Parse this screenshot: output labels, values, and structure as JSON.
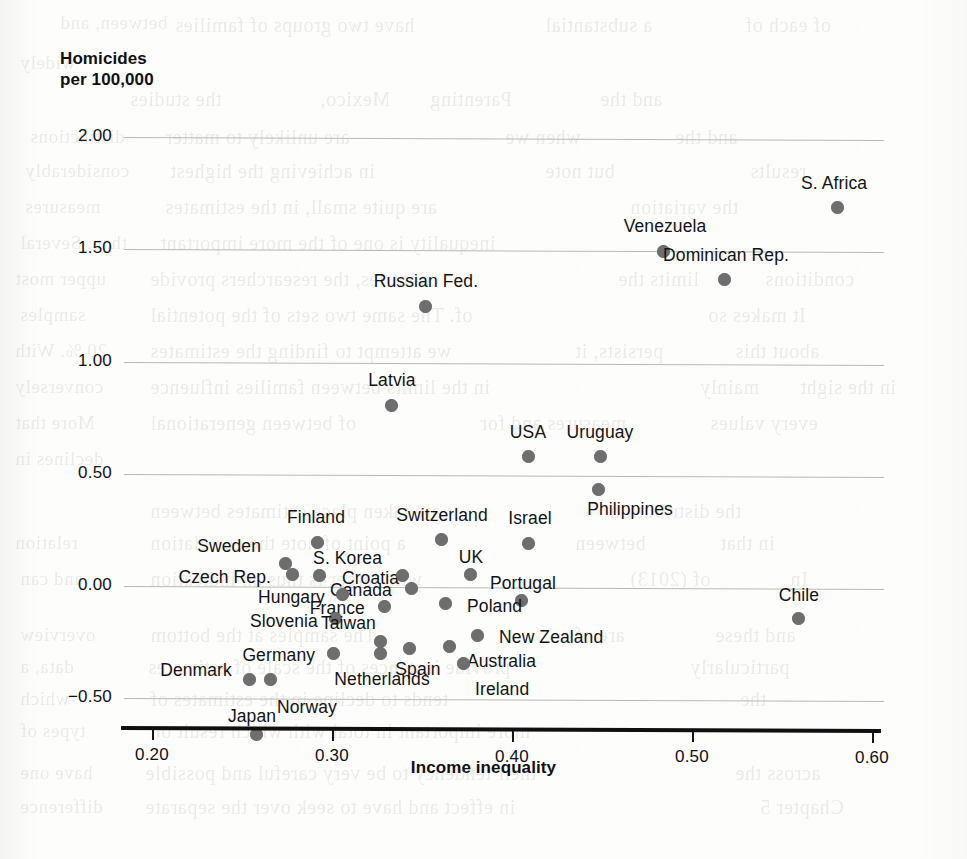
{
  "chart_data": {
    "type": "scatter",
    "title": "",
    "ylabel_line1": "Homicides",
    "ylabel_line2": "per 100,000",
    "xlabel": "Income inequality",
    "xlim": [
      0.155,
      0.635
    ],
    "ylim": [
      -0.62,
      2.16
    ],
    "grid": true,
    "legend": "none",
    "xticks": [
      "0.20",
      "0.30",
      "0.40",
      "0.50",
      "0.60"
    ],
    "xtick_values": [
      0.2,
      0.3,
      0.4,
      0.5,
      0.6
    ],
    "yticks": [
      "2.00",
      "1.50",
      "1.00",
      "0.50",
      "0.00",
      "−0.50"
    ],
    "ytick_values": [
      2.0,
      1.5,
      1.0,
      0.5,
      0.0,
      -0.5
    ],
    "point_color": "#6e6e6e",
    "points": [
      {
        "label": "S. Africa",
        "x": 0.5806,
        "y": 1.685,
        "lx": -3,
        "ly": -26,
        "anchor": "middle"
      },
      {
        "label": "Venezuela",
        "x": 0.4839,
        "y": 1.49,
        "lx": 2,
        "ly": -26,
        "anchor": "middle"
      },
      {
        "label": "Dominican Rep.",
        "x": 0.5178,
        "y": 1.365,
        "lx": 2,
        "ly": -26,
        "anchor": "middle"
      },
      {
        "label": "Russian Fed.",
        "x": 0.3522,
        "y": 1.245,
        "lx": 0,
        "ly": -26,
        "anchor": "middle"
      },
      {
        "label": "Latvia",
        "x": 0.3333,
        "y": 0.805,
        "lx": 0,
        "ly": -26,
        "anchor": "middle"
      },
      {
        "label": "USA",
        "x": 0.4089,
        "y": 0.575,
        "lx": 0,
        "ly": -26,
        "anchor": "middle"
      },
      {
        "label": "Uruguay",
        "x": 0.4489,
        "y": 0.575,
        "lx": 0,
        "ly": -26,
        "anchor": "middle"
      },
      {
        "label": "Philippines",
        "x": 0.4478,
        "y": 0.43,
        "lx": 32,
        "ly": 19,
        "anchor": "middle"
      },
      {
        "label": "Israel",
        "x": 0.4089,
        "y": 0.19,
        "lx": 2,
        "ly": -26,
        "anchor": "middle"
      },
      {
        "label": "Switzerland",
        "x": 0.3611,
        "y": 0.205,
        "lx": 0,
        "ly": -26,
        "anchor": "middle"
      },
      {
        "label": "Finland",
        "x": 0.2922,
        "y": 0.195,
        "lx": -2,
        "ly": -26,
        "anchor": "middle"
      },
      {
        "label": "Sweden",
        "x": 0.2739,
        "y": 0.1,
        "lx": -24,
        "ly": -19,
        "anchor": "end"
      },
      {
        "label": "Czech Rep.",
        "x": 0.2783,
        "y": 0.05,
        "lx": -22,
        "ly": 1,
        "anchor": "end"
      },
      {
        "label": "Croatia",
        "x": 0.2933,
        "y": 0.045,
        "lx": 22,
        "ly": 1,
        "anchor": "start"
      },
      {
        "label": "S. Korea",
        "x": 0.3389,
        "y": 0.045,
        "lx": -20,
        "ly": -19,
        "anchor": "end"
      },
      {
        "label": "Canada",
        "x": 0.3444,
        "y": -0.01,
        "lx": -20,
        "ly": 1,
        "anchor": "end"
      },
      {
        "label": "UK",
        "x": 0.3772,
        "y": 0.05,
        "lx": 0,
        "ly": -19,
        "anchor": "middle"
      },
      {
        "label": "Portugal",
        "x": 0.405,
        "y": -0.065,
        "lx": 2,
        "ly": -19,
        "anchor": "middle"
      },
      {
        "label": "Hungary",
        "x": 0.3061,
        "y": -0.04,
        "lx": -18,
        "ly": 1,
        "anchor": "end"
      },
      {
        "label": "France",
        "x": 0.3294,
        "y": -0.09,
        "lx": -20,
        "ly": 1,
        "anchor": "end"
      },
      {
        "label": "Slovenia",
        "x": 0.3022,
        "y": -0.145,
        "lx": -18,
        "ly": 1,
        "anchor": "end"
      },
      {
        "label": "Poland",
        "x": 0.3628,
        "y": -0.08,
        "lx": 22,
        "ly": 1,
        "anchor": "start"
      },
      {
        "label": "Taiwan",
        "x": 0.3272,
        "y": -0.245,
        "lx": -5,
        "ly": -19,
        "anchor": "end"
      },
      {
        "label": "Germany",
        "x": 0.3006,
        "y": -0.3,
        "lx": -18,
        "ly": 1,
        "anchor": "end"
      },
      {
        "label": "New Zealand",
        "x": 0.3806,
        "y": -0.22,
        "lx": 22,
        "ly": 1,
        "anchor": "start"
      },
      {
        "label": "Australia",
        "x": 0.365,
        "y": -0.27,
        "lx": 18,
        "ly": 13,
        "anchor": "start"
      },
      {
        "label": "Spain",
        "x": 0.3433,
        "y": -0.28,
        "lx": 8,
        "ly": 19,
        "anchor": "middle"
      },
      {
        "label": "Netherlands",
        "x": 0.3267,
        "y": -0.3,
        "lx": 2,
        "ly": 25,
        "anchor": "middle"
      },
      {
        "label": "Ireland",
        "x": 0.3728,
        "y": -0.345,
        "lx": 12,
        "ly": 25,
        "anchor": "start"
      },
      {
        "label": "Denmark",
        "x": 0.2544,
        "y": -0.415,
        "lx": -18,
        "ly": -10,
        "anchor": "end"
      },
      {
        "label": "Norway",
        "x": 0.2661,
        "y": -0.415,
        "lx": 36,
        "ly": 27,
        "anchor": "middle"
      },
      {
        "label": "Japan",
        "x": 0.2578,
        "y": -0.66,
        "lx": -4,
        "ly": -19,
        "anchor": "middle"
      },
      {
        "label": "Chile",
        "x": 0.5594,
        "y": -0.145,
        "lx": 0,
        "ly": -25,
        "anchor": "middle"
      }
    ]
  },
  "bleed_text": [
    {
      "t": "between, and",
      "x": 60,
      "y": 12,
      "s": 19
    },
    {
      "t": "have two groups of families",
      "x": 175,
      "y": 14,
      "s": 20
    },
    {
      "t": "a substantial",
      "x": 545,
      "y": 14,
      "s": 20
    },
    {
      "t": "of each of",
      "x": 745,
      "y": 14,
      "s": 20
    },
    {
      "t": "widely",
      "x": 20,
      "y": 52,
      "s": 19
    },
    {
      "t": "the studies",
      "x": 130,
      "y": 88,
      "s": 20
    },
    {
      "t": "Mexico,",
      "x": 320,
      "y": 88,
      "s": 20
    },
    {
      "t": "Parenting",
      "x": 430,
      "y": 88,
      "s": 20
    },
    {
      "t": "and the",
      "x": 600,
      "y": 88,
      "s": 20
    },
    {
      "t": "distinctions",
      "x": 30,
      "y": 126,
      "s": 19
    },
    {
      "t": "are unlikely to matter",
      "x": 165,
      "y": 126,
      "s": 20
    },
    {
      "t": "when we",
      "x": 505,
      "y": 126,
      "s": 20
    },
    {
      "t": "and the",
      "x": 675,
      "y": 126,
      "s": 20
    },
    {
      "t": "considerably",
      "x": 25,
      "y": 160,
      "s": 19
    },
    {
      "t": "in achieving the highest",
      "x": 170,
      "y": 160,
      "s": 20
    },
    {
      "t": "but note",
      "x": 545,
      "y": 160,
      "s": 20
    },
    {
      "t": "results",
      "x": 750,
      "y": 160,
      "s": 20
    },
    {
      "t": "measures",
      "x": 25,
      "y": 196,
      "s": 19
    },
    {
      "t": "are quite small, in the estimates",
      "x": 165,
      "y": 196,
      "s": 20
    },
    {
      "t": "the variation",
      "x": 630,
      "y": 196,
      "s": 20
    },
    {
      "t": "than. Several",
      "x": 20,
      "y": 232,
      "s": 19
    },
    {
      "t": "inequality is one of the more important",
      "x": 160,
      "y": 232,
      "s": 20
    },
    {
      "t": "upper most",
      "x": 15,
      "y": 268,
      "s": 19
    },
    {
      "t": "countries, the researchers provide",
      "x": 150,
      "y": 268,
      "s": 20
    },
    {
      "t": "limits the",
      "x": 618,
      "y": 268,
      "s": 20
    },
    {
      "t": "conditions",
      "x": 765,
      "y": 268,
      "s": 20
    },
    {
      "t": "samples",
      "x": 20,
      "y": 304,
      "s": 19
    },
    {
      "t": "of. The same two sets of the potential",
      "x": 150,
      "y": 304,
      "s": 20
    },
    {
      "t": "It makes so",
      "x": 708,
      "y": 304,
      "s": 20
    },
    {
      "t": "20 %. With",
      "x": 15,
      "y": 340,
      "s": 19
    },
    {
      "t": "we attempt to finding the estimates",
      "x": 150,
      "y": 340,
      "s": 20
    },
    {
      "t": "persists, it",
      "x": 575,
      "y": 340,
      "s": 20
    },
    {
      "t": "about this",
      "x": 735,
      "y": 340,
      "s": 20
    },
    {
      "t": "conversely",
      "x": 15,
      "y": 376,
      "s": 19
    },
    {
      "t": "in the limits between families influence",
      "x": 150,
      "y": 376,
      "s": 20
    },
    {
      "t": "mainly",
      "x": 700,
      "y": 376,
      "s": 20
    },
    {
      "t": "in the sight",
      "x": 800,
      "y": 376,
      "s": 20
    },
    {
      "t": "More that",
      "x": 15,
      "y": 412,
      "s": 19
    },
    {
      "t": "of between generational",
      "x": 150,
      "y": 412,
      "s": 20
    },
    {
      "t": "measures and for",
      "x": 480,
      "y": 412,
      "s": 20
    },
    {
      "t": "every values",
      "x": 710,
      "y": 412,
      "s": 20
    },
    {
      "t": "declines in",
      "x": 15,
      "y": 448,
      "s": 19
    },
    {
      "t": "are taken place estimates between",
      "x": 150,
      "y": 500,
      "s": 20
    },
    {
      "t": "the distribution",
      "x": 610,
      "y": 500,
      "s": 20
    },
    {
      "t": "relation",
      "x": 15,
      "y": 532,
      "s": 19
    },
    {
      "t": "a point of note the correlation",
      "x": 150,
      "y": 532,
      "s": 20
    },
    {
      "t": "between",
      "x": 575,
      "y": 532,
      "s": 20
    },
    {
      "t": "in that",
      "x": 720,
      "y": 532,
      "s": 20
    },
    {
      "t": "and can",
      "x": 20,
      "y": 568,
      "s": 19
    },
    {
      "t": "with larger is thus an indication",
      "x": 150,
      "y": 568,
      "s": 20
    },
    {
      "t": "of (2013)",
      "x": 630,
      "y": 568,
      "s": 20
    },
    {
      "t": "In",
      "x": 790,
      "y": 568,
      "s": 20
    },
    {
      "t": "overview",
      "x": 20,
      "y": 624,
      "s": 19
    },
    {
      "t": "The samples at the bottom",
      "x": 150,
      "y": 624,
      "s": 20
    },
    {
      "t": "are of a",
      "x": 560,
      "y": 624,
      "s": 20
    },
    {
      "t": "and these",
      "x": 715,
      "y": 624,
      "s": 20
    },
    {
      "t": "data, a",
      "x": 20,
      "y": 656,
      "s": 19
    },
    {
      "t": "provide instances of the scale of estimates",
      "x": 148,
      "y": 656,
      "s": 20
    },
    {
      "t": "particularly",
      "x": 690,
      "y": 656,
      "s": 20
    },
    {
      "t": "which",
      "x": 20,
      "y": 688,
      "s": 19
    },
    {
      "t": "tends to decline in the estimates of",
      "x": 150,
      "y": 688,
      "s": 20
    },
    {
      "t": "the",
      "x": 740,
      "y": 688,
      "s": 20
    },
    {
      "t": "types of",
      "x": 20,
      "y": 720,
      "s": 19
    },
    {
      "t": "more important in total with which result on",
      "x": 150,
      "y": 720,
      "s": 20
    },
    {
      "t": "have one",
      "x": 20,
      "y": 762,
      "s": 19
    },
    {
      "t": "their tendency to be very careful and possible",
      "x": 145,
      "y": 762,
      "s": 20
    },
    {
      "t": "across the",
      "x": 735,
      "y": 762,
      "s": 20
    },
    {
      "t": "difference",
      "x": 20,
      "y": 796,
      "s": 19
    },
    {
      "t": "in effect and have to seek over the separate",
      "x": 145,
      "y": 796,
      "s": 20
    },
    {
      "t": "Chapter 5",
      "x": 760,
      "y": 796,
      "s": 20
    }
  ]
}
